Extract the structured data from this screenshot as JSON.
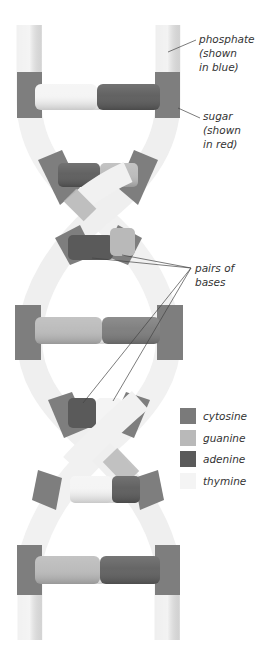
{
  "diagram": {
    "colors": {
      "phosphate": "#f2f2f2",
      "sugar": "#7e7e7e",
      "cytosine": "#7a7a7a",
      "guanine": "#b9b9b9",
      "adenine": "#5a5a5a",
      "thymine": "#f4f4f4"
    },
    "labels": {
      "phosphate": [
        "phosphate",
        "(shown",
        "in blue)"
      ],
      "sugar": [
        "sugar",
        "(shown",
        "in red)"
      ],
      "pairs": [
        "pairs of",
        "bases"
      ]
    },
    "legend": [
      {
        "key": "cytosine",
        "label": "cytosine",
        "color": "#7a7a7a"
      },
      {
        "key": "guanine",
        "label": "guanine",
        "color": "#b9b9b9"
      },
      {
        "key": "adenine",
        "label": "adenine",
        "color": "#5a5a5a"
      },
      {
        "key": "thymine",
        "label": "thymine",
        "color": "#f4f4f4"
      }
    ],
    "base_pairs": [
      {
        "left": "thymine",
        "right": "adenine"
      },
      {
        "left": "adenine",
        "right": "guanine"
      },
      {
        "left": "adenine",
        "right": "guanine"
      },
      {
        "left": "guanine",
        "right": "cytosine"
      },
      {
        "left": "adenine",
        "right": "thymine"
      },
      {
        "left": "thymine",
        "right": "adenine"
      },
      {
        "left": "guanine",
        "right": "cytosine"
      }
    ]
  }
}
